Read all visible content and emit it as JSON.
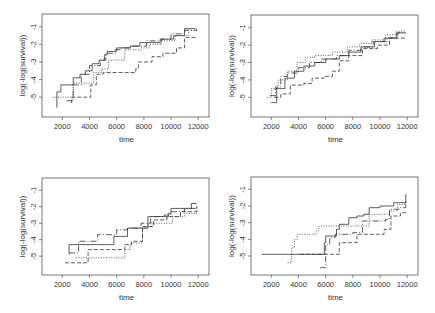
{
  "chart_data": [
    {
      "type": "line",
      "step": true,
      "panel": "top-left",
      "xlabel": "time",
      "ylabel": "log(-log(survival))",
      "xlim": [
        800,
        12500
      ],
      "ylim": [
        -5.9,
        -0.5
      ],
      "xticks": [
        2000,
        4000,
        6000,
        8000,
        10000,
        12000
      ],
      "xtick_labels": [
        "2000",
        "4000",
        "6000",
        "8000",
        "10000",
        "12000"
      ],
      "yticks": [
        -1,
        -2,
        -3,
        -4,
        -5
      ],
      "ytick_labels": [
        "-1",
        "-2",
        "-3",
        "-4",
        "-5"
      ],
      "series": [
        {
          "name": "solid",
          "style": "solid",
          "x": [
            1600,
            1600,
            1900,
            2600,
            2800,
            3300,
            3700,
            4200,
            4700,
            5100,
            5300,
            6000,
            7000,
            7700,
            8500,
            9200,
            10200,
            11000,
            11800
          ],
          "y": [
            -5.6,
            -4.7,
            -4.3,
            -4.3,
            -3.9,
            -3.7,
            -3.5,
            -3.1,
            -2.9,
            -2.6,
            -2.4,
            -2.2,
            -2.1,
            -1.9,
            -1.9,
            -1.7,
            -1.5,
            -1.1,
            -1.1
          ]
        },
        {
          "name": "dotted",
          "style": "dotted",
          "x": [
            1300,
            2700,
            2800,
            4100,
            4300,
            4900,
            5400,
            6300,
            6600,
            7800,
            8400,
            9300,
            10300,
            11300,
            11900
          ],
          "y": [
            -5.0,
            -5.0,
            -4.2,
            -4.2,
            -3.6,
            -3.4,
            -2.9,
            -2.9,
            -2.3,
            -2.2,
            -2.0,
            -1.8,
            -1.5,
            -1.2,
            -1.2
          ]
        },
        {
          "name": "dashed",
          "style": "dashed",
          "x": [
            2600,
            2700,
            3700,
            4100,
            4500,
            5000,
            6500,
            7400,
            7600,
            8600,
            9400,
            10400,
            11000,
            11800
          ],
          "y": [
            -5.3,
            -5.0,
            -5.0,
            -4.3,
            -3.7,
            -3.6,
            -3.6,
            -3.4,
            -3.0,
            -2.7,
            -2.5,
            -2.2,
            -1.6,
            -1.6
          ]
        },
        {
          "name": "dot-dash",
          "style": "dotdash",
          "x": [
            2300,
            2800,
            2800,
            3400,
            4000,
            4800,
            5200,
            5900,
            6300,
            7000,
            8200,
            9300,
            10000,
            11000,
            11900
          ],
          "y": [
            -5.2,
            -5.2,
            -4.3,
            -3.7,
            -3.2,
            -2.9,
            -2.5,
            -2.3,
            -2.2,
            -2.1,
            -1.8,
            -1.7,
            -1.4,
            -1.2,
            -1.1
          ]
        }
      ]
    },
    {
      "type": "line",
      "step": true,
      "panel": "top-right",
      "xlabel": "time",
      "ylabel": "log(-log(survival))",
      "xlim": [
        800,
        12500
      ],
      "ylim": [
        -5.9,
        -0.5
      ],
      "xticks": [
        2000,
        4000,
        6000,
        8000,
        10000,
        12000
      ],
      "xtick_labels": [
        "2000",
        "4000",
        "6000",
        "8000",
        "10000",
        "12000"
      ],
      "yticks": [
        -1,
        -2,
        -3,
        -4,
        -5
      ],
      "ytick_labels": [
        "-1",
        "-2",
        "-3",
        "-4",
        "-5"
      ],
      "series": [
        {
          "name": "solid",
          "style": "solid",
          "x": [
            2000,
            2400,
            2400,
            3000,
            3700,
            4400,
            5200,
            6000,
            7000,
            7700,
            8600,
            9600,
            10300,
            11200,
            11900
          ],
          "y": [
            -5.3,
            -5.3,
            -4.5,
            -3.9,
            -3.5,
            -3.2,
            -3.0,
            -2.8,
            -2.6,
            -2.4,
            -2.1,
            -1.8,
            -1.6,
            -1.3,
            -1.3
          ]
        },
        {
          "name": "dotted",
          "style": "dotted",
          "x": [
            1700,
            2000,
            2500,
            3200,
            3900,
            4500,
            5200,
            6500,
            7600,
            8500,
            9400,
            10400,
            11200,
            11900
          ],
          "y": [
            -5.0,
            -4.5,
            -4.0,
            -3.5,
            -3.0,
            -2.7,
            -2.6,
            -2.4,
            -2.1,
            -1.9,
            -1.7,
            -1.4,
            -1.2,
            -1.2
          ]
        },
        {
          "name": "dashed",
          "style": "dashed",
          "x": [
            2200,
            2700,
            3400,
            4400,
            5000,
            5900,
            6500,
            7000,
            7700,
            8700,
            9800,
            10700,
            11900
          ],
          "y": [
            -5.0,
            -4.8,
            -4.3,
            -4.2,
            -3.9,
            -3.8,
            -3.5,
            -2.9,
            -2.6,
            -2.2,
            -2.0,
            -1.6,
            -1.6
          ]
        },
        {
          "name": "dot-dash",
          "style": "dotdash",
          "x": [
            1900,
            2300,
            2700,
            3200,
            4000,
            4800,
            5700,
            6800,
            7700,
            8600,
            9500,
            10500,
            11300,
            11900
          ],
          "y": [
            -4.9,
            -4.4,
            -3.8,
            -3.6,
            -3.3,
            -3.0,
            -2.8,
            -2.6,
            -2.3,
            -2.1,
            -1.8,
            -1.6,
            -1.3,
            -1.3
          ]
        }
      ]
    },
    {
      "type": "line",
      "step": true,
      "panel": "bottom-left",
      "xlabel": "time",
      "ylabel": "log(-log(survival))",
      "xlim": [
        800,
        12500
      ],
      "ylim": [
        -5.9,
        -0.5
      ],
      "xticks": [
        2000,
        4000,
        6000,
        8000,
        10000,
        12000
      ],
      "xtick_labels": [
        "2000",
        "4000",
        "6000",
        "8000",
        "10000",
        "12000"
      ],
      "yticks": [
        -1,
        -2,
        -3,
        -4,
        -5
      ],
      "ytick_labels": [
        "-1",
        "-2",
        "-3",
        "-4",
        "-5"
      ],
      "series": [
        {
          "name": "solid",
          "style": "solid",
          "x": [
            2500,
            2500,
            5800,
            5800,
            6800,
            6800,
            7800,
            8300,
            9800,
            10000,
            11300,
            11500,
            11900
          ],
          "y": [
            -4.9,
            -4.3,
            -4.3,
            -3.8,
            -3.8,
            -3.3,
            -3.3,
            -2.6,
            -2.4,
            -2.1,
            -2.1,
            -1.8,
            -1.8
          ]
        },
        {
          "name": "dotted",
          "style": "dotted",
          "x": [
            3000,
            6600,
            6600,
            7000,
            7900,
            8300,
            9200,
            10100,
            11000,
            11900
          ],
          "y": [
            -5.1,
            -5.1,
            -4.6,
            -4.2,
            -3.3,
            -3.0,
            -3.0,
            -2.6,
            -2.4,
            -2.1
          ]
        },
        {
          "name": "dashed",
          "style": "dashed",
          "x": [
            2200,
            3900,
            3900,
            6600,
            6600,
            7100,
            7900,
            8700,
            9700,
            10700,
            11900
          ],
          "y": [
            -5.4,
            -5.4,
            -4.6,
            -4.6,
            -4.3,
            -4.1,
            -3.2,
            -2.8,
            -2.6,
            -2.3,
            -2.0
          ]
        },
        {
          "name": "dot-dash",
          "style": "dotdash",
          "x": [
            2500,
            3200,
            4600,
            4600,
            6000,
            6800,
            7800,
            8500,
            9500,
            10000,
            11000,
            11900
          ],
          "y": [
            -4.8,
            -4.1,
            -4.1,
            -3.7,
            -3.4,
            -3.3,
            -3.0,
            -2.6,
            -2.5,
            -2.3,
            -2.1,
            -1.9
          ]
        }
      ]
    },
    {
      "type": "line",
      "step": true,
      "panel": "bottom-right",
      "xlabel": "time",
      "ylabel": "log(-log(survival))",
      "xlim": [
        800,
        12500
      ],
      "ylim": [
        -5.9,
        -0.5
      ],
      "xticks": [
        2000,
        4000,
        6000,
        8000,
        10000,
        12000
      ],
      "xtick_labels": [
        "2000",
        "4000",
        "6000",
        "8000",
        "10000",
        "12000"
      ],
      "yticks": [
        -1,
        -2,
        -3,
        -4,
        -5
      ],
      "ytick_labels": [
        "-1",
        "-2",
        "-3",
        "-4",
        "-5"
      ],
      "series": [
        {
          "name": "solid",
          "style": "solid",
          "x": [
            1300,
            3200,
            5900,
            6000,
            6800,
            7000,
            7700,
            8300,
            8800,
            9200,
            10000,
            11000,
            11900,
            11900
          ],
          "y": [
            -4.9,
            -4.9,
            -4.2,
            -3.8,
            -3.4,
            -3.1,
            -2.7,
            -2.6,
            -2.5,
            -2.1,
            -2.0,
            -1.8,
            -1.7,
            -1.3
          ]
        },
        {
          "name": "dotted",
          "style": "dotted",
          "x": [
            3200,
            3500,
            3700,
            3900,
            5300,
            5500,
            7500,
            9200,
            10700,
            11300,
            11900
          ],
          "y": [
            -5.4,
            -4.5,
            -4.0,
            -3.7,
            -3.5,
            -3.2,
            -3.2,
            -2.5,
            -2.3,
            -1.9,
            -1.7
          ]
        },
        {
          "name": "dashed",
          "style": "dashed",
          "x": [
            4100,
            7000,
            7000,
            8300,
            8300,
            9900,
            10300,
            10800,
            11500,
            11900
          ],
          "y": [
            -4.9,
            -4.9,
            -4.2,
            -4.2,
            -3.7,
            -3.7,
            -3.4,
            -2.6,
            -2.4,
            -2.3
          ]
        },
        {
          "name": "dot-dash",
          "style": "dotdash",
          "x": [
            5600,
            6000,
            6300,
            6700,
            8000,
            8700,
            10400,
            10700,
            11400,
            11900
          ],
          "y": [
            -5.7,
            -4.3,
            -3.9,
            -3.7,
            -3.6,
            -2.9,
            -2.8,
            -2.2,
            -2.1,
            -1.7
          ]
        }
      ]
    }
  ]
}
